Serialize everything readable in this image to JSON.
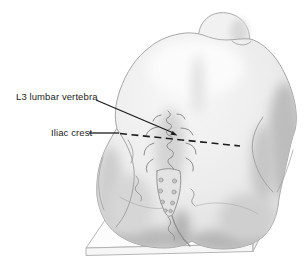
{
  "illustration": {
    "subject": "Posterior view of a seated patient flexed forward, showing lumbar spine landmarks on the lower back",
    "labels": [
      {
        "id": "l3-lumbar-vertebra",
        "text": "L3 lumbar vertebra"
      },
      {
        "id": "iliac-crest",
        "text": "Iliac crest"
      }
    ],
    "annotations": [
      {
        "id": "l3-leader",
        "type": "solid-leader-line-with-arrow"
      },
      {
        "id": "iliac-crest-level",
        "type": "dashed-line-across-back"
      }
    ]
  },
  "colors": {
    "background": "#ffffff",
    "ink": "#1d1d1d",
    "outline": "#a6a6a6",
    "skin": "#eeeeee",
    "skin_light": "#f8f8f8",
    "shadow": "#bdbdbd",
    "spine_ink": "#8c8c8c"
  }
}
